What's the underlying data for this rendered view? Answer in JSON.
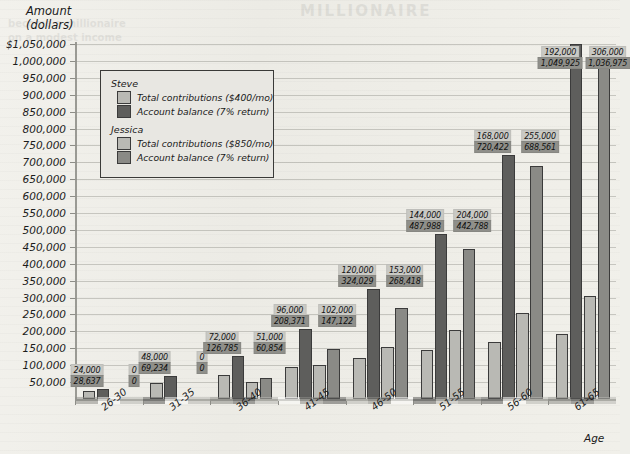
{
  "axis": {
    "y_title_line1": "Amount",
    "y_title_line2": "(dollars)",
    "x_title": "Age",
    "y_ticks": [
      "$1,050,000",
      "1,000,000",
      "950,000",
      "900,000",
      "850,000",
      "800,000",
      "750,000",
      "700,000",
      "650,000",
      "600,000",
      "550,000",
      "500,000",
      "450,000",
      "400,000",
      "350,000",
      "300,000",
      "250,000",
      "200,000",
      "150,000",
      "100,000",
      "50,000"
    ]
  },
  "legend": {
    "steve_heading": "Steve",
    "steve_contrib": "Total contributions ($400/mo)",
    "steve_balance": "Account balance (7% return)",
    "jessica_heading": "Jessica",
    "jessica_contrib": "Total contributions ($850/mo)",
    "jessica_balance": "Account balance (7% return)"
  },
  "ghost": {
    "title": "MILLIONAIRE",
    "line1": "become a millionaire",
    "line2": "on a modest income"
  },
  "colors": {
    "contributions": "#b9b9b4",
    "steve_balance": "#5e5e5c",
    "jessica_balance": "#8a8a86",
    "background": "#efefea",
    "axis": "#9a9a94"
  },
  "chart_data": {
    "type": "bar",
    "title": "",
    "xlabel": "Age",
    "ylabel": "Amount (dollars)",
    "ylim": [
      0,
      1050000
    ],
    "ytick_step": 50000,
    "grid": true,
    "legend_position": "upper-left-inset",
    "categories": [
      "26-30",
      "31-35",
      "36-40",
      "41-45",
      "46-50",
      "51-55",
      "56-60",
      "61-65"
    ],
    "series": [
      {
        "name": "Steve — Total contributions ($400/mo)",
        "key": "steve_contrib",
        "values": [
          24000,
          48000,
          72000,
          96000,
          120000,
          144000,
          168000,
          192000
        ],
        "labels": [
          "24,000",
          "48,000",
          "72,000",
          "96,000",
          "120,000",
          "144,000",
          "168,000",
          "192,000"
        ]
      },
      {
        "name": "Steve — Account balance (7% return)",
        "key": "steve_balance",
        "values": [
          28637,
          69234,
          126785,
          208371,
          324029,
          487988,
          720422,
          1049925
        ],
        "labels": [
          "28,637",
          "69,234",
          "126,785",
          "208,371",
          "324,029",
          "487,988",
          "720,422",
          "1,049,925"
        ]
      },
      {
        "name": "Jessica — Total contributions ($850/mo)",
        "key": "jessica_contrib",
        "values": [
          0,
          0,
          51000,
          102000,
          153000,
          204000,
          255000,
          306000
        ],
        "labels": [
          "0",
          "0",
          "51,000",
          "102,000",
          "153,000",
          "204,000",
          "255,000",
          "306,000"
        ]
      },
      {
        "name": "Jessica — Account balance (7% return)",
        "key": "jessica_balance",
        "values": [
          0,
          0,
          60854,
          147122,
          268418,
          442788,
          688561,
          1036975
        ],
        "labels": [
          "0",
          "0",
          "60,854",
          "147,122",
          "268,418",
          "442,788",
          "688,561",
          "1,036,975"
        ]
      }
    ]
  }
}
